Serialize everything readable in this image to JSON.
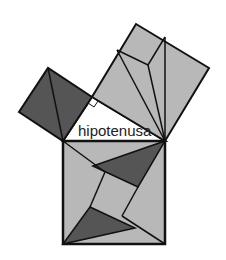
{
  "diagram": {
    "label_hypotenuse": "hipotenusa",
    "colors": {
      "light_fill": "#b8b8b8",
      "dark_fill": "#555555",
      "stroke": "#111111",
      "background": "#ffffff"
    },
    "shapes": [
      {
        "name": "square-on-short-leg",
        "fill": "dark"
      },
      {
        "name": "square-on-long-leg",
        "fill": "light"
      },
      {
        "name": "square-on-hypotenuse",
        "fill": "light"
      },
      {
        "name": "right-triangle",
        "fill": "white"
      }
    ]
  }
}
